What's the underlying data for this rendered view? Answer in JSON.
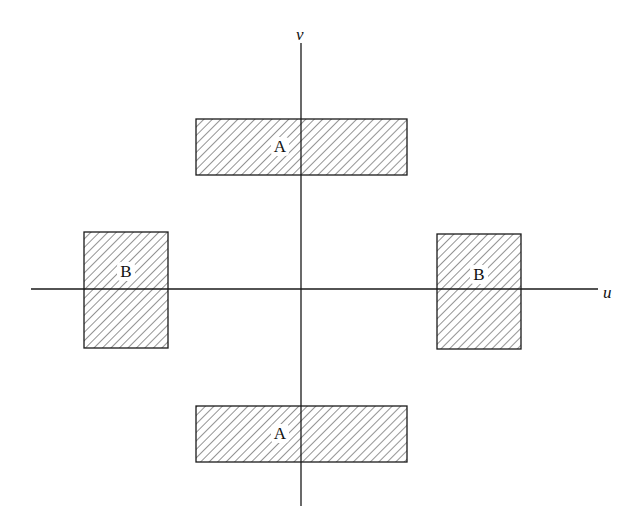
{
  "diagram": {
    "axes": {
      "horizontal": {
        "label": "u",
        "x1": 31,
        "x2": 598,
        "y": 289,
        "label_x": 603,
        "label_y": 298
      },
      "vertical": {
        "label": "v",
        "x": 301,
        "y1": 43,
        "y2": 506,
        "label_x": 296,
        "label_y": 40
      }
    },
    "regions": [
      {
        "id": "A-top",
        "label": "A",
        "x": 196,
        "y": 119,
        "w": 211,
        "h": 56,
        "label_x": 280,
        "label_y": 152
      },
      {
        "id": "A-bottom",
        "label": "A",
        "x": 196,
        "y": 406,
        "w": 211,
        "h": 56,
        "label_x": 280,
        "label_y": 439
      },
      {
        "id": "B-left",
        "label": "B",
        "x": 84,
        "y": 232,
        "w": 84,
        "h": 116,
        "label_x": 126,
        "label_y": 277
      },
      {
        "id": "B-right",
        "label": "B",
        "x": 437,
        "y": 234,
        "w": 84,
        "h": 115,
        "label_x": 479,
        "label_y": 280
      }
    ],
    "colors": {
      "stroke": "#1a1a1a",
      "hatch": "#2a2a2a",
      "background": "#ffffff"
    }
  }
}
